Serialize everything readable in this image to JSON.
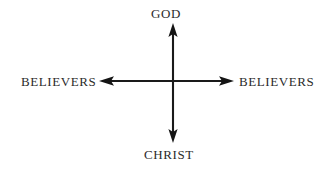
{
  "canvas": {
    "width": 327,
    "height": 170,
    "background_color": "#ffffff"
  },
  "diagram": {
    "type": "cross-axis-arrow-diagram",
    "line_color": "#1a1a1a",
    "text_color": "#2b2b2b",
    "center": {
      "x": 173,
      "y": 81
    },
    "axes": [
      {
        "name": "vertical-axis",
        "orientation": "vertical",
        "from": {
          "x": 173,
          "y": 142
        },
        "to": {
          "x": 173,
          "y": 24
        },
        "arrowheads": [
          "up",
          "down"
        ],
        "top_label": "GOD",
        "bottom_label": "CHRIST"
      },
      {
        "name": "horizontal-axis",
        "orientation": "horizontal",
        "from": {
          "x": 100,
          "y": 81
        },
        "to": {
          "x": 233,
          "y": 81
        },
        "arrowheads": [
          "left",
          "right"
        ],
        "left_label": "BELIEVERS",
        "right_label": "BELIEVERS"
      }
    ]
  },
  "labels": {
    "top": "GOD",
    "bottom": "CHRIST",
    "left": "BELIEVERS",
    "right": "BELIEVERS"
  }
}
